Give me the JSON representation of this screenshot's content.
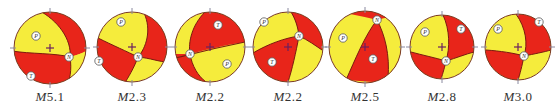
{
  "figure": {
    "colors": {
      "compressional": "#e8251a",
      "dilatational": "#f5ec3c",
      "outline": "#7a3a20",
      "plane": "#7a1a10",
      "axis_marker_fill": "#ffffff",
      "axis_marker_stroke": "#555555",
      "cross": "#6a2060",
      "tick": "#8a8aa0"
    },
    "mechanisms": [
      {
        "id": 1,
        "label_prefix": "M",
        "magnitude": "5.1",
        "cx": 50,
        "cy": 48,
        "r": 36,
        "axes": [
          {
            "symbol": "P",
            "x": 36,
            "y": 36
          },
          {
            "symbol": "N",
            "x": 69,
            "y": 57
          },
          {
            "symbol": "T",
            "x": 31,
            "y": 76
          }
        ]
      },
      {
        "id": 2,
        "label_prefix": "M",
        "magnitude": "2.3",
        "cx": 132,
        "cy": 47,
        "r": 35,
        "axes": [
          {
            "symbol": "P",
            "x": 121,
            "y": 22
          },
          {
            "symbol": "N",
            "x": 138,
            "y": 57
          },
          {
            "symbol": "T",
            "x": 99,
            "y": 61
          }
        ]
      },
      {
        "id": 3,
        "label_prefix": "M",
        "magnitude": "2.2",
        "cx": 210,
        "cy": 47,
        "r": 35,
        "axes": [
          {
            "symbol": "T",
            "x": 218,
            "y": 25
          },
          {
            "symbol": "N",
            "x": 190,
            "y": 54
          },
          {
            "symbol": "P",
            "x": 227,
            "y": 64
          }
        ]
      },
      {
        "id": 4,
        "label_prefix": "M",
        "magnitude": "2.2",
        "cx": 288,
        "cy": 47,
        "r": 35,
        "axes": [
          {
            "symbol": "P",
            "x": 264,
            "y": 22
          },
          {
            "symbol": "N",
            "x": 299,
            "y": 36
          },
          {
            "symbol": "T",
            "x": 272,
            "y": 62
          }
        ]
      },
      {
        "id": 5,
        "label_prefix": "M",
        "magnitude": "2.5",
        "cx": 365,
        "cy": 47,
        "r": 36,
        "axes": [
          {
            "symbol": "N",
            "x": 377,
            "y": 20
          },
          {
            "symbol": "P",
            "x": 343,
            "y": 38
          },
          {
            "symbol": "T",
            "x": 373,
            "y": 59
          }
        ]
      },
      {
        "id": 6,
        "label_prefix": "M",
        "magnitude": "2.8",
        "cx": 442,
        "cy": 47,
        "r": 32,
        "axes": [
          {
            "symbol": "P",
            "x": 425,
            "y": 32
          },
          {
            "symbol": "T",
            "x": 461,
            "y": 29
          },
          {
            "symbol": "N",
            "x": 446,
            "y": 61
          }
        ]
      },
      {
        "id": 7,
        "label_prefix": "M",
        "magnitude": "3.0",
        "cx": 518,
        "cy": 47,
        "r": 33,
        "axes": [
          {
            "symbol": "P",
            "x": 498,
            "y": 29
          },
          {
            "symbol": "T",
            "x": 539,
            "y": 22
          },
          {
            "symbol": "N",
            "x": 524,
            "y": 56
          }
        ]
      }
    ]
  }
}
